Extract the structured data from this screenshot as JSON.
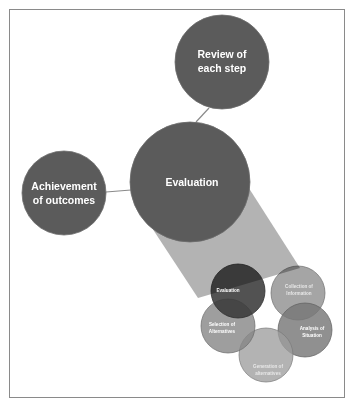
{
  "diagram": {
    "background_color": "#ffffff",
    "frame_color": "#8a8a8a",
    "big_circle_color": "#5b5b5b",
    "cone_color": "#b3b3b3",
    "connector_color": "#8a8a8a",
    "big_nodes": [
      {
        "id": "review",
        "label_line1": "Review of",
        "label_line2": "each step",
        "cx": 222,
        "cy": 62,
        "r": 47
      },
      {
        "id": "achievement",
        "label_line1": "Achievement",
        "label_line2": "of outcomes",
        "cx": 64,
        "cy": 193,
        "r": 42
      },
      {
        "id": "evaluation",
        "label_line1": "Evaluation",
        "label_line2": "",
        "cx": 190,
        "cy": 182,
        "r": 60
      }
    ],
    "connectors": [
      {
        "id": "review-to-evaluation",
        "x1": 209,
        "y1": 108,
        "x2": 196,
        "y2": 122
      },
      {
        "id": "achievement-to-evaluation",
        "x1": 106,
        "y1": 192,
        "x2": 131,
        "y2": 190
      }
    ],
    "cone": {
      "id": "evaluation-to-cluster-cone",
      "points": "152,228 245,182 300,268 198,298"
    },
    "cluster": {
      "title": "Decision making cycle",
      "petals": [
        {
          "id": "evaluation-small",
          "label_line1": "Evaluation",
          "label_line2": "",
          "cx": 238,
          "cy": 291,
          "r": 27,
          "fill": "#3a3a3a",
          "opacity": 0.88,
          "label_x": 228,
          "label_y": 290
        },
        {
          "id": "collection-of-information",
          "label_line1": "Collection of",
          "label_line2": "Information",
          "cx": 298,
          "cy": 293,
          "r": 27,
          "fill": "#8f8f8f",
          "opacity": 0.8,
          "label_x": 292,
          "label_y": 289
        },
        {
          "id": "analysis-of-situation",
          "label_line1": "Analysis of",
          "label_line2": "Situation",
          "cx": 305,
          "cy": 330,
          "r": 27,
          "fill": "#777777",
          "opacity": 0.82,
          "label_x": 304,
          "label_y": 328
        },
        {
          "id": "generation-of-alternatives",
          "label_line1": "Generation of",
          "label_line2": "alternatives",
          "cx": 266,
          "cy": 355,
          "r": 27,
          "fill": "#9e9e9e",
          "opacity": 0.78,
          "label_x": 264,
          "label_y": 366
        },
        {
          "id": "selection-of-alternatives",
          "label_line1": "Selection of",
          "label_line2": "Alternatives",
          "cx": 228,
          "cy": 326,
          "r": 27,
          "fill": "#868686",
          "opacity": 0.8,
          "label_x": 221,
          "label_y": 326
        }
      ]
    }
  }
}
